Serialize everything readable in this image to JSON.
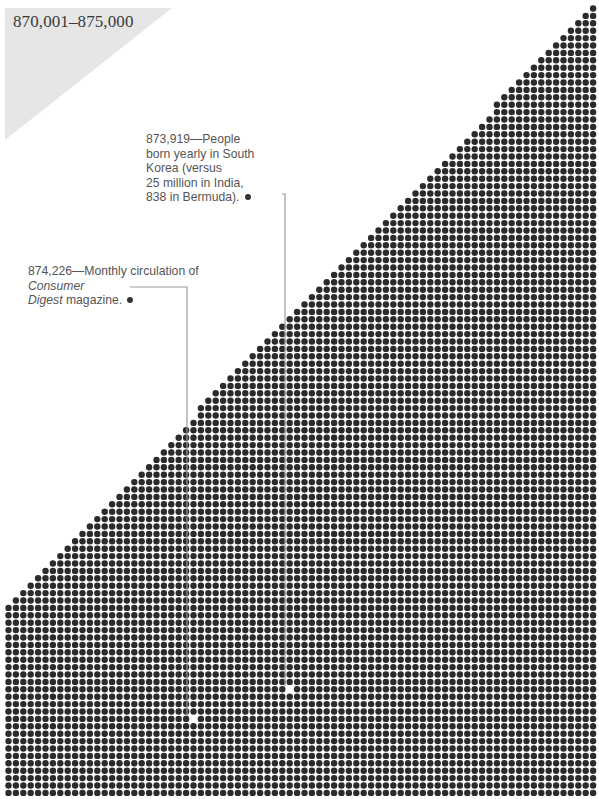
{
  "header": {
    "range_label": "870,001–875,000"
  },
  "annotations": [
    {
      "id": "korea-births",
      "number": "873,919",
      "dash": "—",
      "text_lines": [
        "873,919—People",
        "born yearly in South",
        "Korea (versus",
        "25 million in India,",
        "838 in Bermuda)."
      ],
      "marker": {
        "x": 289,
        "y": 689
      },
      "leader": {
        "start_x": 282,
        "start_y": 194,
        "corner_x": 285,
        "end_y": 686
      }
    },
    {
      "id": "consumer-digest",
      "number": "874,226",
      "text_prefix": "874,226—Monthly circulation of ",
      "italic_title_1": "Consumer",
      "italic_title_2": "Digest",
      "text_suffix": " magazine.",
      "marker": {
        "x": 193,
        "y": 719
      },
      "leader": {
        "start_x": 130,
        "start_y": 287,
        "corner_x": 187,
        "end_y": 716
      }
    }
  ],
  "grid": {
    "x0": 8.5,
    "y0": 8.5,
    "pitch": 7.4,
    "cols": 80,
    "rows": 107,
    "dot_radius": 3.2,
    "dot_color": "#2b2b2b",
    "hypotenuse": {
      "x1": 597,
      "y1": 2,
      "x2": 2,
      "y2": 612
    }
  },
  "colors": {
    "background": "#ffffff",
    "tab_gray": "#e6e6e6",
    "leader": "#9a9a9a",
    "text": "#555555"
  }
}
